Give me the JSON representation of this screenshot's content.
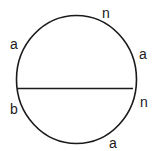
{
  "diagram": {
    "stroke_color": "#1a1a1a",
    "circle": {
      "cx": 76.5,
      "cy": 79.5,
      "rx": 60,
      "ry": 64
    },
    "chord": {
      "x1": 17,
      "y1": 88.5,
      "x2": 133,
      "y2": 88.5
    },
    "labels": [
      {
        "id": "top-right",
        "text": "n",
        "x": 102,
        "y": 6
      },
      {
        "id": "left-upper",
        "text": "a",
        "x": 10,
        "y": 37
      },
      {
        "id": "right-upper",
        "text": "a",
        "x": 139,
        "y": 47
      },
      {
        "id": "left-lower",
        "text": "b",
        "x": 10,
        "y": 102
      },
      {
        "id": "right-lower",
        "text": "n",
        "x": 140,
        "y": 95
      },
      {
        "id": "bottom-right",
        "text": "a",
        "x": 109,
        "y": 136
      }
    ]
  }
}
